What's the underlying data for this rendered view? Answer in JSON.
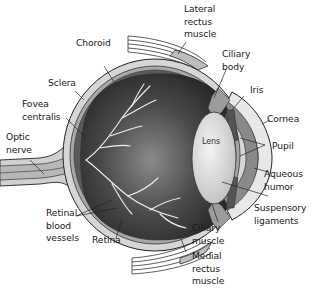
{
  "diagram": {
    "labels": {
      "lateral_rectus": "Lateral\nrectus\nmuscle",
      "choroid": "Choroid",
      "ciliary_body": "Ciliary\nbody",
      "sclera": "Sclera",
      "iris": "Iris",
      "fovea": "Fovea\ncentralis",
      "cornea": "Cornea",
      "optic_nerve": "Optic\nnerve",
      "lens": "Lens",
      "pupil": "Pupil",
      "aqueous": "Aqueous\nhumor",
      "suspensory": "Suspensory\nligaments",
      "retinal_vessels": "Retinal\nblood\nvessels",
      "retina": "Retina",
      "ciliary_muscle": "Ciliary\nmuscle",
      "medial_rectus": "Medial\nrectus\nmuscle"
    },
    "colors": {
      "sclera": "#d6d6d6",
      "choroid": "#9a9a9a",
      "vitreous_dark": "#2e2e2e",
      "vitreous_light": "#7a7a7a",
      "lens": "#e4e4e4",
      "cornea": "#f2f2f2",
      "aqueous": "#8a8a8a",
      "outline": "#222222"
    }
  }
}
